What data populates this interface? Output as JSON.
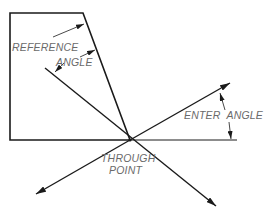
{
  "diagram": {
    "type": "angle-construction",
    "labels": {
      "reference": "REFERENCE",
      "reference_angle": "ANGLE",
      "enter_angle": "ENTER  ANGLE",
      "through": "THROUGH",
      "point": "POINT"
    },
    "colors": {
      "line": "#1a1a1a",
      "text": "#6a6a6a",
      "background": "#ffffff"
    }
  }
}
